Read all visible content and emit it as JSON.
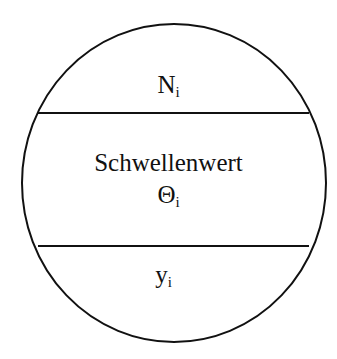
{
  "neuron": {
    "input": {
      "symbol": "N",
      "subscript": "i"
    },
    "threshold": {
      "label": "Schwellenwert",
      "symbol": "Θ",
      "subscript": "i"
    },
    "output": {
      "symbol": "y",
      "subscript": "i"
    }
  },
  "colors": {
    "stroke": "#111111",
    "background": "#ffffff"
  }
}
